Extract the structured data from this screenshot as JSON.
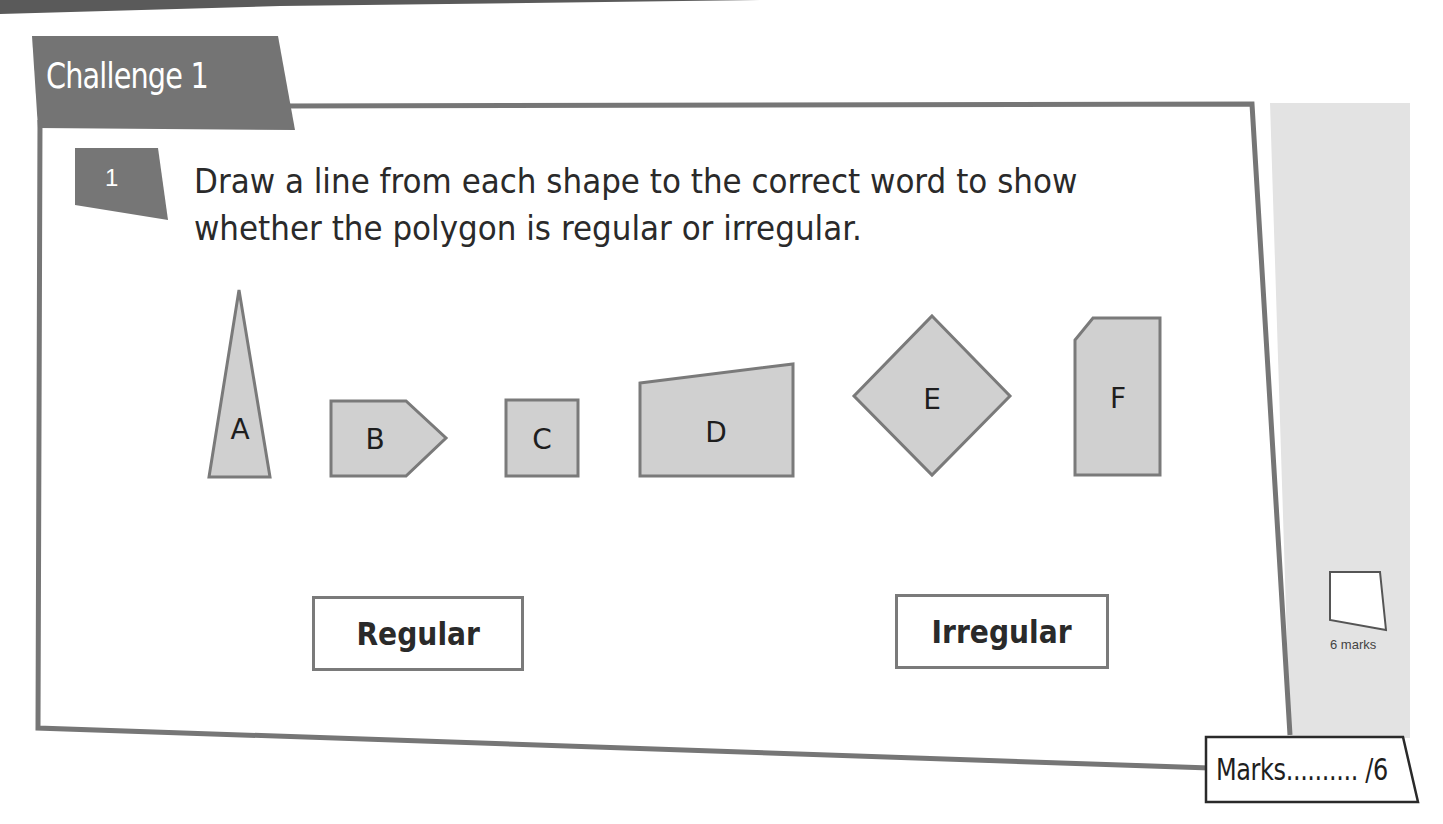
{
  "section": {
    "title": "Challenge 1",
    "colors": {
      "banner": "#747474",
      "frame": "#767676",
      "shape_fill": "#d0d0d0",
      "shape_stroke": "#7a7a7a",
      "margin_panel": "#e3e3e3"
    }
  },
  "question": {
    "number": "1",
    "text": "Draw a line from each shape to the correct word to show whether the polygon is regular or irregular."
  },
  "shapes": [
    {
      "label": "A",
      "type": "tall-triangle"
    },
    {
      "label": "B",
      "type": "pentagon-arrow"
    },
    {
      "label": "C",
      "type": "square"
    },
    {
      "label": "D",
      "type": "trapezium"
    },
    {
      "label": "E",
      "type": "rhombus-square"
    },
    {
      "label": "F",
      "type": "cut-corner-pentagon"
    }
  ],
  "answer_words": {
    "regular": "Regular",
    "irregular": "Irregular"
  },
  "margin": {
    "marks_box_label": "6 marks"
  },
  "marks_footer": {
    "text": "Marks.......... /6"
  }
}
